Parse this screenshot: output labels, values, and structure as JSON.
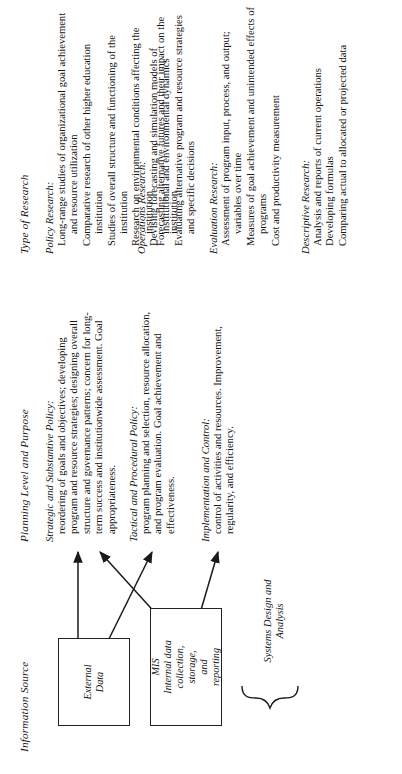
{
  "page": {
    "rotation": "90deg counter-clockwise",
    "background": "#ffffff",
    "ink": "#141414"
  },
  "columns": {
    "information_source": {
      "header": "Information Source",
      "boxes": [
        {
          "id": "external",
          "lines": [
            "External",
            "Data"
          ]
        },
        {
          "id": "mis",
          "lines": [
            "MIS",
            "Internal data",
            "collection,",
            "storage,",
            "and",
            "reporting"
          ]
        }
      ],
      "brace_label": "Systems Design and Analysis"
    },
    "planning_level": {
      "header": "Planning Level and Purpose",
      "groups": [
        {
          "title": "Strategic and Substantive Policy:",
          "body": "reordering of goals and objectives; developing program and resource strategies; designing overall structure and governance patterns; concern for long-term success and institutionwide assessment. Goal appropriateness."
        },
        {
          "title": "Tactical and Procedural Policy:",
          "body": "program planning and selection, resource allocation, and program evaluation. Goal achievement and effectiveness."
        },
        {
          "title": "Implementation and Control:",
          "body": "control of activities and resources. Improvement, regularity, and efficiency."
        }
      ]
    },
    "type_of_research": {
      "header": "Type of Research",
      "groups": [
        {
          "title": "Policy Research:",
          "items": [
            "Long-range studies of organizational goal achievement and resource utilization",
            "Comparative research of other higher education institution",
            "Studies of overall structure and functioning of the institution",
            "Research on environmental conditions affecting the institution",
            "Forecasting alternative futures and their impact on the institution"
          ]
        },
        {
          "title": "Operations Research:",
          "items": [
            "Devising forecasting and simulation models of institutional and environmental dynamics",
            "Evaluating alternative program and resource strategies and specific decisions"
          ]
        },
        {
          "title": "Evaluation Research:",
          "items": [
            "Assessment of program input, process, and output; variables over time",
            "Measures of goal achievement and unintended effects of programs",
            "Cost and productivity measurement"
          ]
        },
        {
          "title": "Descriptive Research:",
          "items": [
            "Analysis and reports of current operations",
            "Developing formulas",
            "Comparing actual to allocated or projected data"
          ]
        }
      ]
    }
  }
}
